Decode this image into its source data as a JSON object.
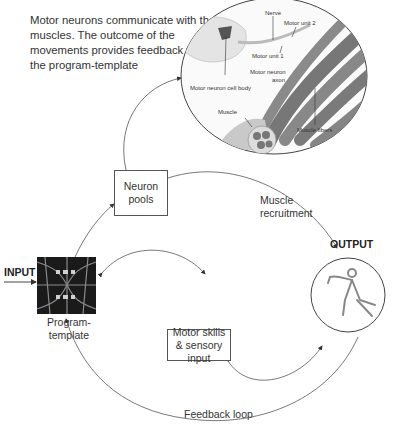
{
  "caption": "Motor neurons communicate with the muscles. The outcome of the movements provides feedback to refine the program-template",
  "illustration": {
    "labels": {
      "nerve": "Nerve",
      "motor_unit_2": "Motor unit 2",
      "motor_unit_1": "Motor unit 1",
      "motor_neuron_axon": "Motor neuron axon",
      "motor_neuron_cell_body": "Motor neuron cell body",
      "muscle": "Muscle",
      "muscle_fibers": "Muscle fibers"
    }
  },
  "nodes": {
    "input": "INPUT",
    "program_template": "Program-template",
    "neuron_pools": "Neuron pools",
    "motor_skills": "Motor skills & sensory input",
    "output": "OUTPUT"
  },
  "edges": {
    "muscle_recruitment": "Muscle recruitment",
    "feedback_loop": "Feedback loop"
  },
  "colors": {
    "line": "#555555",
    "text": "#333333",
    "muscle_dark": "#6e6e6e",
    "muscle_light": "#bdbdbd"
  }
}
